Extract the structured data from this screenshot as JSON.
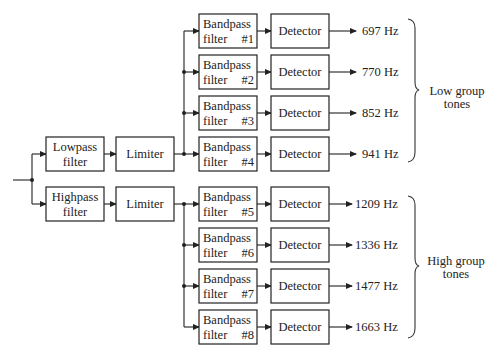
{
  "diagram": {
    "front_end": {
      "lowpass": {
        "line1": "Lowpass",
        "line2": "filter"
      },
      "highpass": {
        "line1": "Highpass",
        "line2": "filter"
      },
      "limiter_low": "Limiter",
      "limiter_high": "Limiter"
    },
    "bandpass_line1": "Bandpass",
    "bandpass_line2": "filter",
    "detector_label": "Detector",
    "channels": [
      {
        "filter_num": "#1",
        "freq": "697 Hz"
      },
      {
        "filter_num": "#2",
        "freq": "770 Hz"
      },
      {
        "filter_num": "#3",
        "freq": "852 Hz"
      },
      {
        "filter_num": "#4",
        "freq": "941 Hz"
      },
      {
        "filter_num": "#5",
        "freq": "1209 Hz"
      },
      {
        "filter_num": "#6",
        "freq": "1336 Hz"
      },
      {
        "filter_num": "#7",
        "freq": "1477 Hz"
      },
      {
        "filter_num": "#8",
        "freq": "1663 Hz"
      }
    ],
    "groups": {
      "low": {
        "line1": "Low group",
        "line2": "tones"
      },
      "high": {
        "line1": "High group",
        "line2": "tones"
      }
    },
    "colors": {
      "line": "#222222",
      "background": "#ffffff"
    }
  }
}
